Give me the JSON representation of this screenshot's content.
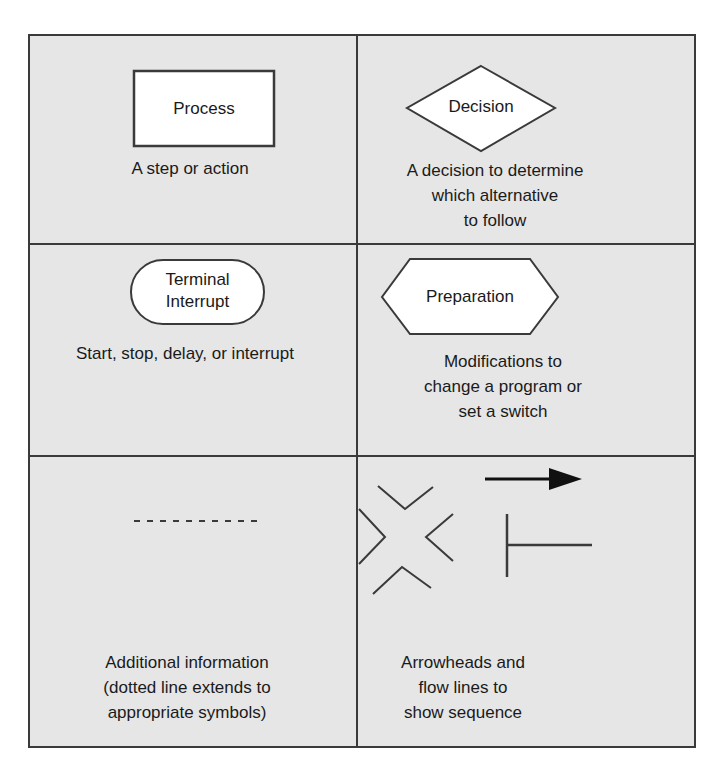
{
  "symbols": [
    {
      "name": "Process",
      "shape": "rectangle",
      "label": "Process",
      "description_lines": [
        "A step or action"
      ]
    },
    {
      "name": "Decision",
      "shape": "diamond",
      "label": "Decision",
      "description_lines": [
        "A decision to determine",
        "which alternative",
        "to follow"
      ]
    },
    {
      "name": "Terminal Interrupt",
      "shape": "rounded-rectangle",
      "label_lines": [
        "Terminal",
        "Interrupt"
      ],
      "description_lines": [
        "Start, stop, delay, or interrupt"
      ]
    },
    {
      "name": "Preparation",
      "shape": "hexagon",
      "label": "Preparation",
      "description_lines": [
        "Modifications to",
        "change a program or",
        "set a switch"
      ]
    },
    {
      "name": "Annotation",
      "shape": "dashed-line",
      "description_lines": [
        "Additional information",
        "(dotted line extends to",
        "appropriate symbols)"
      ]
    },
    {
      "name": "Flow lines",
      "shape": "arrowheads-and-flow-lines",
      "description_lines": [
        "Arrowheads and",
        "flow lines to",
        "show sequence"
      ]
    }
  ],
  "colors": {
    "cell_background": "#e6e6e6",
    "border": "#3a3a3a",
    "shape_fill": "#ffffff",
    "text": "#1a1a1a"
  }
}
